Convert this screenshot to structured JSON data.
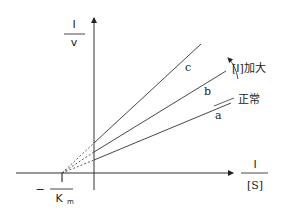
{
  "diagram": {
    "y_axis": {
      "numerator": "I",
      "denominator": "v"
    },
    "x_axis": {
      "numerator": "I",
      "denominator": "[S]"
    },
    "intercept": {
      "sign": "−",
      "numerator": "I",
      "denominator": "K",
      "subscript": "m"
    },
    "lines": [
      {
        "id": "a",
        "label": "a",
        "note": "正常"
      },
      {
        "id": "b",
        "label": "b"
      },
      {
        "id": "c",
        "label": "c"
      }
    ],
    "arrow_note": "[I]加大"
  }
}
